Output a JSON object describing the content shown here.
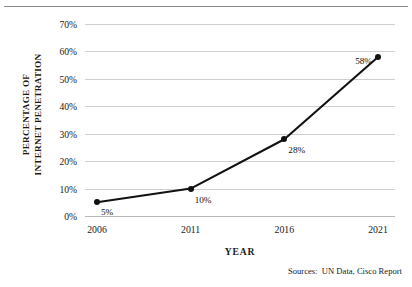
{
  "chart_data": {
    "type": "line",
    "title": "",
    "xlabel": "YEAR",
    "ylabel": "PERCENTAGE OF INTERNET PENETRATION",
    "ylabel_lines": [
      "PERCENTAGE OF",
      "INTERNET PENETRATION"
    ],
    "categories": [
      "2006",
      "2011",
      "2016",
      "2021"
    ],
    "x": [
      2006,
      2011,
      2016,
      2021
    ],
    "values": [
      5,
      10,
      28,
      58
    ],
    "point_labels": [
      "5%",
      "10%",
      "28%",
      "58%"
    ],
    "ytick_labels": [
      "70%",
      "60%",
      "50%",
      "40%",
      "30%",
      "20%",
      "10%",
      "0%"
    ],
    "ytick_values": [
      70,
      60,
      50,
      40,
      30,
      20,
      10,
      0
    ],
    "ylim": [
      0,
      70
    ],
    "grid": true,
    "legend": "none",
    "series_color": "#111111",
    "grid_color": "#cfcfcf",
    "annotation": "Sources:  UN Data, Cisco Report"
  }
}
